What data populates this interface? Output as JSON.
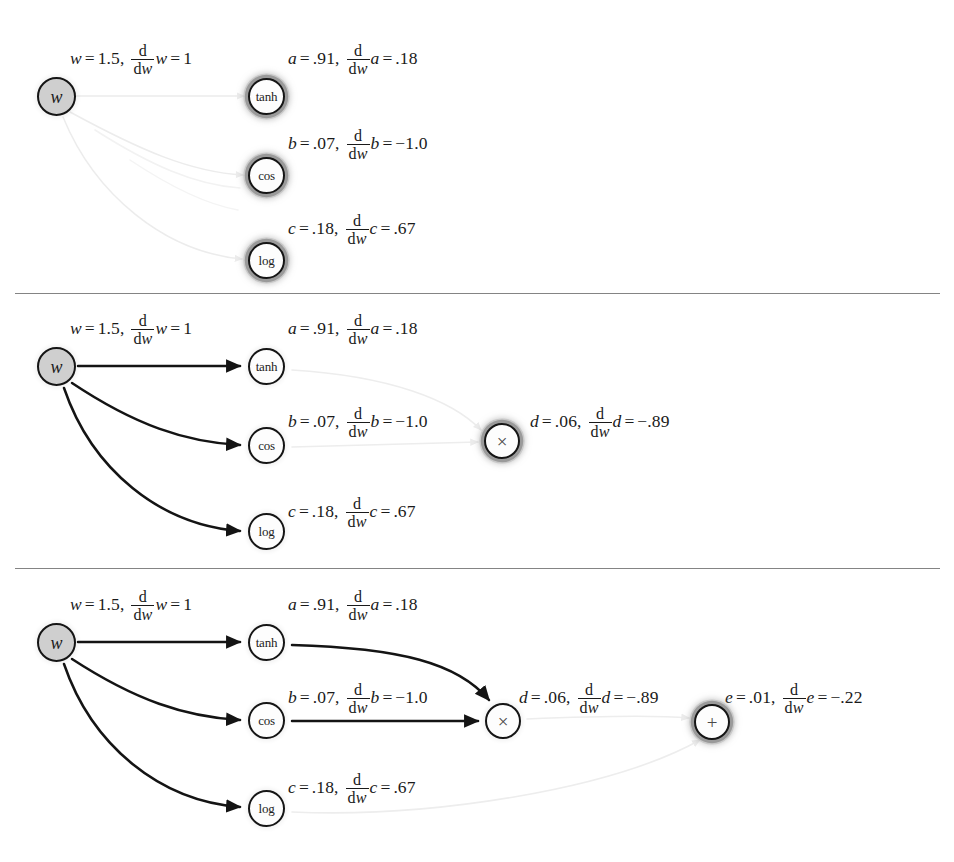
{
  "figure": {
    "type": "computation-graph-forward-ad",
    "background": "#ffffff",
    "ink_color": "#1a1a1a",
    "input_node_fill": "#cfcfcf",
    "highlight_ring_color": "#9a9a9a",
    "ghost_edge_color": "#ededed"
  },
  "glyphs": {
    "equals": "=",
    "comma": ",",
    "minus": "−",
    "d_numerator": "d",
    "d_denom_d": "d",
    "d_denom_w": "w",
    "times_symbol": "×",
    "plus_symbol": "+"
  },
  "nodes": {
    "w": "w",
    "tanh": "tanh",
    "cos": "cos",
    "log": "log",
    "mul": "×",
    "add": "+"
  },
  "values": {
    "w": {
      "var": "w",
      "value": "1.5",
      "deriv_value": "1"
    },
    "a": {
      "var": "a",
      "value": ".91",
      "deriv_value": ".18"
    },
    "b": {
      "var": "b",
      "value": ".07",
      "deriv_value": "−1.0"
    },
    "c": {
      "var": "c",
      "value": ".18",
      "deriv_value": ".67"
    },
    "d": {
      "var": "d",
      "value": ".06",
      "deriv_value": "−.89"
    },
    "e": {
      "var": "e",
      "value": ".01",
      "deriv_value": "−.22"
    }
  },
  "panels": [
    {
      "id": "panel-1",
      "caption": "",
      "active_nodes": [
        "tanh",
        "cos",
        "log"
      ],
      "visible_labels": [
        "w",
        "a",
        "b",
        "c"
      ],
      "edges_state": "ghost"
    },
    {
      "id": "panel-2",
      "caption": "",
      "active_nodes": [
        "mul"
      ],
      "visible_labels": [
        "w",
        "a",
        "b",
        "c",
        "d"
      ],
      "edges_state": "partial"
    },
    {
      "id": "panel-3",
      "caption": "",
      "active_nodes": [
        "add"
      ],
      "visible_labels": [
        "w",
        "a",
        "b",
        "c",
        "d",
        "e"
      ],
      "edges_state": "full"
    }
  ]
}
